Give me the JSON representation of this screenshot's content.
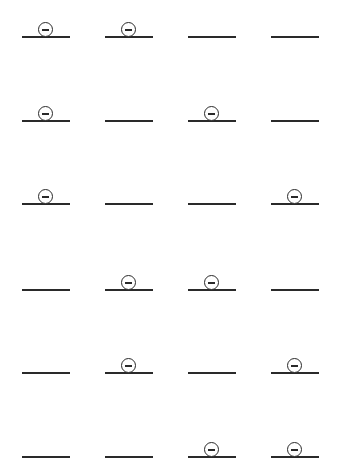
{
  "diagram": {
    "symbol": "circled-minus",
    "line_color": "#2a2a2a",
    "background": "#ffffff",
    "columns_x": [
      22,
      105,
      188,
      271
    ],
    "rows_y": [
      37,
      121,
      204,
      290,
      373,
      457
    ],
    "rows": [
      {
        "cells": [
          true,
          true,
          false,
          false
        ]
      },
      {
        "cells": [
          true,
          false,
          true,
          false
        ]
      },
      {
        "cells": [
          true,
          false,
          false,
          true
        ]
      },
      {
        "cells": [
          false,
          true,
          true,
          false
        ]
      },
      {
        "cells": [
          false,
          true,
          false,
          true
        ]
      },
      {
        "cells": [
          false,
          false,
          true,
          true
        ]
      }
    ]
  }
}
